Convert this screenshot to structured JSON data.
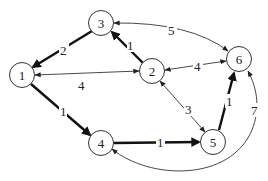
{
  "graph": {
    "type": "weighted-directed-graph",
    "nodes": [
      {
        "id": "1",
        "label": "1",
        "x": 22,
        "y": 75
      },
      {
        "id": "2",
        "label": "2",
        "x": 152,
        "y": 71
      },
      {
        "id": "3",
        "label": "3",
        "x": 101,
        "y": 23
      },
      {
        "id": "4",
        "label": "4",
        "x": 101,
        "y": 143
      },
      {
        "id": "5",
        "label": "5",
        "x": 213,
        "y": 142
      },
      {
        "id": "6",
        "label": "6",
        "x": 239,
        "y": 59
      }
    ],
    "edges": [
      {
        "from": "3",
        "to": "1",
        "weight": "2",
        "style": "bold",
        "direction": "forward"
      },
      {
        "from": "2",
        "to": "3",
        "weight": "1",
        "style": "bold",
        "direction": "forward"
      },
      {
        "from": "1",
        "to": "2",
        "weight": "4",
        "style": "thin",
        "direction": "both"
      },
      {
        "from": "3",
        "to": "6",
        "weight": "5",
        "style": "thin",
        "direction": "both"
      },
      {
        "from": "2",
        "to": "6",
        "weight": "4",
        "style": "thin",
        "direction": "both"
      },
      {
        "from": "2",
        "to": "5",
        "weight": "3",
        "style": "thin",
        "direction": "both"
      },
      {
        "from": "1",
        "to": "4",
        "weight": "1",
        "style": "bold",
        "direction": "forward"
      },
      {
        "from": "4",
        "to": "5",
        "weight": "1",
        "style": "bold",
        "direction": "forward"
      },
      {
        "from": "5",
        "to": "6",
        "weight": "1",
        "style": "bold",
        "direction": "forward"
      },
      {
        "from": "4",
        "to": "6",
        "weight": "7",
        "style": "thin",
        "direction": "both"
      }
    ]
  }
}
